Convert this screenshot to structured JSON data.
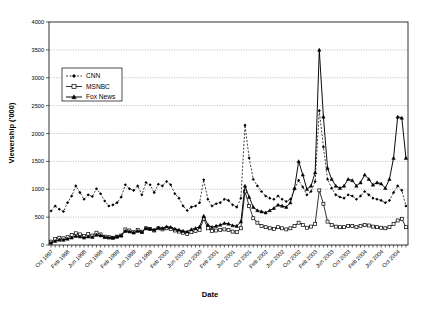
{
  "chart_data": {
    "type": "line",
    "title": "",
    "xlabel": "Date",
    "ylabel": "Viewership ('000)",
    "ylim": [
      0,
      4000
    ],
    "ytick_values": [
      0,
      500,
      1000,
      1500,
      2000,
      2500,
      3000,
      3500,
      4000
    ],
    "ytick_labels": [
      "0",
      "500",
      "1000",
      "1500",
      "2000",
      "2500",
      "3000",
      "3500",
      "4000"
    ],
    "grid": "horizontal-dotted",
    "legend_position": "upper-left-inside",
    "x_tick_interval_months": 1,
    "x_label_interval_months": 4,
    "x": [
      "Oct 1997",
      "Nov 1997",
      "Dec 1997",
      "Jan 1998",
      "Feb 1998",
      "Mar 1998",
      "Apr 1998",
      "May 1998",
      "Jun 1998",
      "Jul 1998",
      "Aug 1998",
      "Sep 1998",
      "Oct 1998",
      "Nov 1998",
      "Dec 1998",
      "Jan 1999",
      "Feb 1999",
      "Mar 1999",
      "Apr 1999",
      "May 1999",
      "Jun 1999",
      "Jul 1999",
      "Aug 1999",
      "Sep 1999",
      "Oct 1999",
      "Nov 1999",
      "Dec 1999",
      "Jan 2000",
      "Feb 2000",
      "Mar 2000",
      "Apr 2000",
      "May 2000",
      "Jun 2000",
      "Jul 2000",
      "Aug 2000",
      "Sep 2000",
      "Oct 2000",
      "Nov 2000",
      "Dec 2000",
      "Jan 2001",
      "Feb 2001",
      "Mar 2001",
      "Apr 2001",
      "May 2001",
      "Jun 2001",
      "Jul 2001",
      "Aug 2001",
      "Sep 2001",
      "Oct 2001",
      "Nov 2001",
      "Dec 2001",
      "Jan 2002",
      "Feb 2002",
      "Mar 2002",
      "Apr 2002",
      "May 2002",
      "Jun 2002",
      "Jul 2002",
      "Aug 2002",
      "Sep 2002",
      "Oct 2002",
      "Nov 2002",
      "Dec 2002",
      "Jan 2003",
      "Feb 2003",
      "Mar 2003",
      "Apr 2003",
      "May 2003",
      "Jun 2003",
      "Jul 2003",
      "Aug 2003",
      "Sep 2003",
      "Oct 2003",
      "Nov 2003",
      "Dec 2003",
      "Jan 2004",
      "Feb 2004",
      "Mar 2004",
      "Apr 2004",
      "May 2004",
      "Jun 2004",
      "Jul 2004",
      "Aug 2004",
      "Sep 2004",
      "Oct 2004",
      "Nov 2004",
      "Dec 2004"
    ],
    "x_labeled_ticks": [
      "Oct 1997",
      "Feb 1998",
      "Jun 1998",
      "Oct 1998",
      "Feb 1999",
      "Jun 1999",
      "Oct 1999",
      "Feb 2000",
      "Jun 2000",
      "Oct 2000",
      "Feb 2001",
      "Jun 2001",
      "Oct 2001",
      "Feb 2002",
      "Jun 2002",
      "Oct 2002",
      "Feb 2003",
      "Jun 2003",
      "Oct 2003",
      "Feb 2004",
      "Jun 2004",
      "Oct 2004"
    ],
    "series": [
      {
        "name": "CNN",
        "marker": "filled-diamond",
        "linestyle": "dashed",
        "color": "#000000",
        "values": [
          610,
          700,
          640,
          600,
          760,
          880,
          1060,
          940,
          820,
          900,
          870,
          1010,
          920,
          790,
          700,
          720,
          760,
          860,
          1080,
          1010,
          980,
          1060,
          900,
          1120,
          1080,
          940,
          1090,
          1060,
          1140,
          1080,
          920,
          840,
          700,
          620,
          680,
          700,
          760,
          1170,
          820,
          700,
          740,
          760,
          820,
          800,
          720,
          680,
          840,
          2150,
          1560,
          1180,
          1060,
          960,
          880,
          840,
          820,
          880,
          820,
          780,
          820,
          1000,
          1160,
          1040,
          900,
          960,
          1140,
          2410,
          1760,
          1180,
          1020,
          900,
          860,
          840,
          900,
          880,
          820,
          880,
          960,
          900,
          840,
          820,
          800,
          760,
          800,
          940,
          1060,
          980,
          700
        ]
      },
      {
        "name": "MSNBC",
        "marker": "open-square",
        "linestyle": "solid",
        "color": "#000000",
        "values": [
          60,
          110,
          130,
          120,
          140,
          180,
          210,
          190,
          160,
          200,
          170,
          220,
          190,
          150,
          140,
          130,
          150,
          170,
          280,
          260,
          230,
          270,
          240,
          300,
          290,
          260,
          300,
          280,
          300,
          290,
          260,
          240,
          220,
          200,
          230,
          250,
          270,
          470,
          300,
          250,
          260,
          270,
          280,
          270,
          240,
          230,
          300,
          960,
          700,
          480,
          400,
          340,
          320,
          300,
          290,
          320,
          300,
          280,
          300,
          340,
          400,
          360,
          310,
          330,
          380,
          980,
          740,
          420,
          360,
          330,
          320,
          320,
          340,
          340,
          320,
          340,
          360,
          350,
          330,
          320,
          310,
          300,
          320,
          380,
          440,
          470,
          320
        ]
      },
      {
        "name": "Fox News",
        "marker": "filled-triangle",
        "linestyle": "solid",
        "color": "#000000",
        "values": [
          40,
          70,
          90,
          90,
          110,
          130,
          160,
          150,
          130,
          150,
          140,
          180,
          170,
          140,
          130,
          130,
          150,
          170,
          250,
          240,
          220,
          250,
          230,
          300,
          290,
          270,
          310,
          300,
          330,
          320,
          290,
          270,
          250,
          240,
          280,
          300,
          330,
          520,
          360,
          320,
          340,
          360,
          390,
          380,
          350,
          340,
          420,
          1060,
          860,
          680,
          620,
          600,
          580,
          620,
          660,
          720,
          700,
          680,
          760,
          1020,
          1500,
          1260,
          1000,
          1060,
          1300,
          3500,
          2300,
          1380,
          1180,
          1060,
          1020,
          1060,
          1180,
          1160,
          1060,
          1120,
          1260,
          1180,
          1080,
          1120,
          1100,
          1020,
          1180,
          1560,
          2300,
          2280,
          1560
        ]
      }
    ]
  },
  "legend": {
    "entries": [
      {
        "label": "CNN"
      },
      {
        "label": "MSNBC"
      },
      {
        "label": "Fox News"
      }
    ]
  }
}
